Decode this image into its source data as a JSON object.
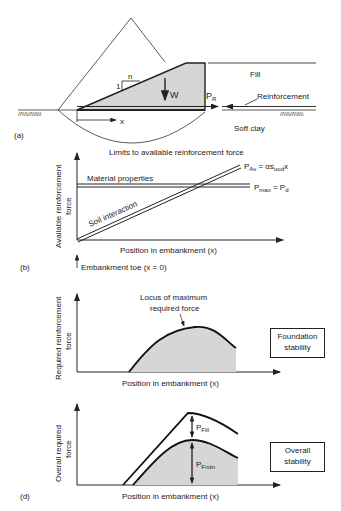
{
  "panel_a": {
    "label": "(a)",
    "slope_n": "n",
    "slope_1": "1",
    "weight": "W",
    "force": "P",
    "force_sub": "R",
    "fill": "Fill",
    "reinforcement": "Reinforcement",
    "soft_clay": "Soft clay",
    "x_axis": "x"
  },
  "panel_b": {
    "label": "(b)",
    "title": "Limits to available reinforcement force",
    "ylabel_1": "Available reinforcement",
    "ylabel_2": "force",
    "xlabel": "Position in embankment (x)",
    "material": "Material properties",
    "soil": "Soil interaction",
    "pav_main": "P",
    "pav_sub": "Av",
    "pav_eq": " = αs",
    "pav_sub2": "uod",
    "pav_tail": "x",
    "pmax_main": "P",
    "pmax_sub": "max",
    "pmax_eq": " = P",
    "pmax_sub2": "d",
    "toe": "Embankment toe (x = 0)"
  },
  "panel_c": {
    "ylabel_1": "Required reinforcement",
    "ylabel_2": "force",
    "xlabel": "Position in embankment (x)",
    "locus_1": "Locus of maximum",
    "locus_2": "required force",
    "box_1": "Foundation",
    "box_2": "stability"
  },
  "panel_d": {
    "label": "(d)",
    "ylabel_1": "Overall required",
    "ylabel_2": "force",
    "xlabel": "Position in embankment (x)",
    "pfill_main": "P",
    "pfill_sub": "Fill",
    "pfndn_main": "P",
    "pfndn_sub": "Fndn",
    "box_1": "Overall",
    "box_2": "stability"
  }
}
